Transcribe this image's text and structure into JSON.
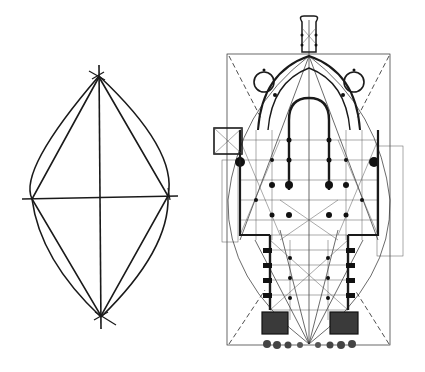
{
  "figure": {
    "left_panel": {
      "subject": "vesica piscis geometric construction",
      "elements": [
        "outer pointed-oval arcs",
        "inscribed rhombus",
        "vertical axis",
        "horizontal axis"
      ]
    },
    "right_panel": {
      "subject": "gothic cathedral ground plan with geometric overlay",
      "elements": [
        "bounding rectangle",
        "dashed diagonals",
        "pointed-oval arc overlay",
        "rib vault grid",
        "apse with radiating chapels",
        "west facade towers"
      ]
    },
    "colors": {
      "background": "#ffffff",
      "ink": "#1a1a1a"
    }
  }
}
